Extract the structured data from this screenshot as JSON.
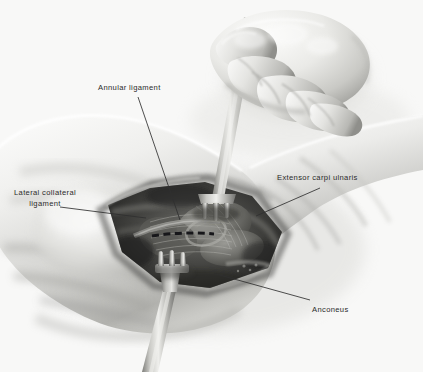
{
  "figure": {
    "type": "medical-illustration",
    "style": "grayscale pencil / airbrush anatomical drawing",
    "background_color": "#f8f8f7",
    "label_text_color": "#2b2b2b",
    "leader_line_color": "#2f2f2f"
  },
  "labels": [
    {
      "id": "annular-ligament",
      "text": "Annular ligament",
      "lines": [
        "Annular ligament"
      ],
      "text_x": 98,
      "text_y": 83,
      "leader_from_x": 138,
      "leader_from_y": 97,
      "leader_to_x": 180,
      "leader_to_y": 220,
      "align": "left"
    },
    {
      "id": "lateral-collateral-ligament",
      "text": "Lateral collateral ligament",
      "lines": [
        "Lateral collateral",
        "ligament"
      ],
      "text_x": 6,
      "text_y": 188,
      "leader_from_x": 60,
      "leader_from_y": 207,
      "leader_to_x": 146,
      "leader_to_y": 218,
      "align": "center"
    },
    {
      "id": "extensor-carpi-ulnaris",
      "text": "Extensor carpi ulnaris",
      "lines": [
        "Extensor carpi ulnaris"
      ],
      "text_x": 277,
      "text_y": 173,
      "leader_from_x": 320,
      "leader_from_y": 188,
      "leader_to_x": 256,
      "leader_to_y": 216,
      "align": "left"
    },
    {
      "id": "anconeus",
      "text": "Anconeus",
      "lines": [
        "Anconeus"
      ],
      "text_x": 312,
      "text_y": 305,
      "leader_from_x": 310,
      "leader_from_y": 300,
      "leader_to_x": 216,
      "leader_to_y": 274,
      "align": "left"
    }
  ],
  "instruments": [
    {
      "id": "upper-retractor",
      "name": "three-prong rake retractor",
      "prongs": 3,
      "position": "superior wound edge, held by gloved hand"
    },
    {
      "id": "lower-retractor",
      "name": "three-prong rake retractor",
      "prongs": 3,
      "position": "inferior wound edge, handle exits bottom of frame"
    }
  ],
  "anatomy": [
    {
      "id": "forearm",
      "name": "forearm"
    },
    {
      "id": "upper-arm",
      "name": "upper arm"
    },
    {
      "id": "surgeon-hand",
      "name": "gloved surgeon hand gripping retractor handle"
    },
    {
      "id": "wound",
      "name": "open surgical wound exposing deep tissue"
    },
    {
      "id": "incision-marking",
      "name": "dashed incision line over the capsule"
    }
  ]
}
